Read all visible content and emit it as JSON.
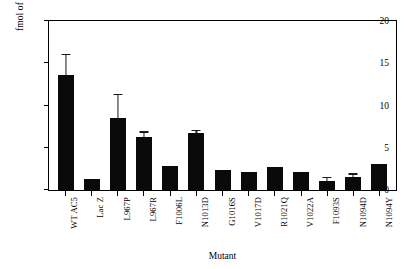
{
  "chart_data": {
    "type": "bar",
    "title": "",
    "xlabel": "Mutant",
    "ylabel": "fmol of Gsα bound",
    "ylim": [
      0,
      20
    ],
    "yticks": [
      0,
      5,
      10,
      15,
      20
    ],
    "ytick_labels": [
      "0",
      "5",
      "10",
      "15",
      "20"
    ],
    "grid": false,
    "legend": "none",
    "categories": [
      "WT AC5",
      "Lac Z",
      "L967P",
      "L967R",
      "F1006L",
      "N1013D",
      "G1016S",
      "V1017D",
      "R1021Q",
      "V1022A",
      "F1093S",
      "N1094D",
      "N1094Y"
    ],
    "values": [
      13.6,
      1.3,
      8.5,
      6.3,
      2.9,
      6.7,
      2.4,
      2.1,
      2.7,
      2.1,
      1.1,
      1.5,
      3.1
    ],
    "errors": [
      2.3,
      0,
      2.7,
      0.5,
      0,
      0.3,
      0,
      0,
      0,
      0,
      0.3,
      0.3,
      0
    ],
    "bar_color": "#0a0a0a"
  }
}
